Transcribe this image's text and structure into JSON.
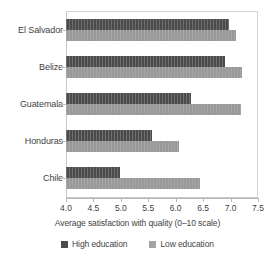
{
  "chart_data": {
    "type": "bar",
    "orientation": "horizontal",
    "title": "",
    "xlabel": "Average satisfaction with quality (0–10 scale)",
    "ylabel": "",
    "xlim": [
      4.0,
      7.5
    ],
    "xticks": [
      "4.0",
      "4.5",
      "5.0",
      "5.5",
      "6.0",
      "6.5",
      "7.0",
      "7.5"
    ],
    "xtick_values": [
      4.0,
      4.5,
      5.0,
      5.5,
      6.0,
      6.5,
      7.0,
      7.5
    ],
    "grid": false,
    "legend_position": "bottom",
    "categories": [
      "El Salvador",
      "Belize",
      "Guatemala",
      "Honduras",
      "Chile"
    ],
    "series": [
      {
        "name": "High education",
        "color": "#4b4b4b",
        "values": [
          6.98,
          6.9,
          6.28,
          5.57,
          4.98
        ]
      },
      {
        "name": "Low education",
        "color": "#999999",
        "values": [
          7.1,
          7.21,
          7.19,
          6.06,
          6.44
        ]
      }
    ]
  }
}
